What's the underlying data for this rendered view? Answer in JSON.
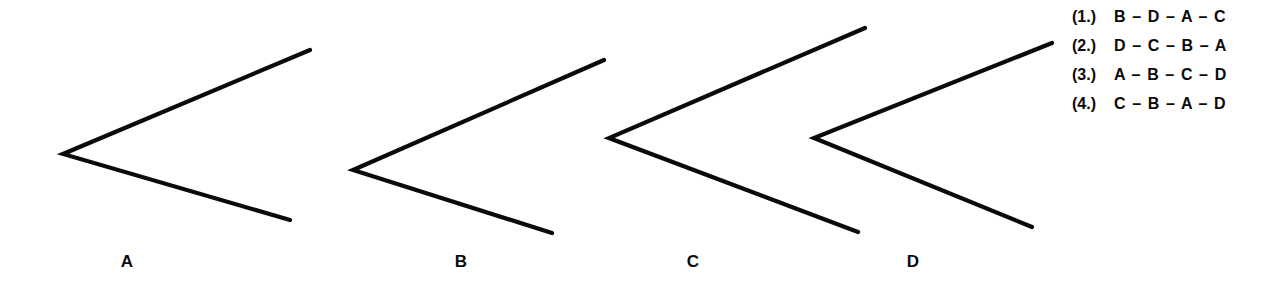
{
  "page": {
    "background_color": "#ffffff",
    "ink_color": "#0a0a0a",
    "width": 1285,
    "height": 290
  },
  "figures": {
    "caption_note": "Four chevron (less-than) shapes of differing size, labeled A through D, arranged left to right.",
    "items": [
      {
        "id": "A",
        "label": "A",
        "label_x": 127,
        "label_y": 262,
        "vertex": [
          63,
          154
        ],
        "upper_end": [
          310,
          50
        ],
        "lower_end": [
          290,
          220
        ],
        "stroke_width": 4.2
      },
      {
        "id": "B",
        "label": "B",
        "label_x": 461,
        "label_y": 262,
        "vertex": [
          353,
          170
        ],
        "upper_end": [
          604,
          60
        ],
        "lower_end": [
          552,
          233
        ],
        "stroke_width": 4.2
      },
      {
        "id": "C",
        "label": "C",
        "label_x": 693,
        "label_y": 262,
        "vertex": [
          609,
          138
        ],
        "upper_end": [
          865,
          28
        ],
        "lower_end": [
          858,
          232
        ],
        "stroke_width": 4.2
      },
      {
        "id": "D",
        "label": "D",
        "label_x": 913,
        "label_y": 262,
        "vertex": [
          814,
          138
        ],
        "upper_end": [
          1052,
          43
        ],
        "lower_end": [
          1032,
          227
        ],
        "stroke_width": 4.2
      }
    ]
  },
  "answers": {
    "options": [
      {
        "number": "(1.)",
        "sequence": "B – D – A – C"
      },
      {
        "number": "(2.)",
        "sequence": "D – C – B – A"
      },
      {
        "number": "(3.)",
        "sequence": "A – B – C – D"
      },
      {
        "number": "(4.)",
        "sequence": "C – B – A – D"
      }
    ]
  }
}
